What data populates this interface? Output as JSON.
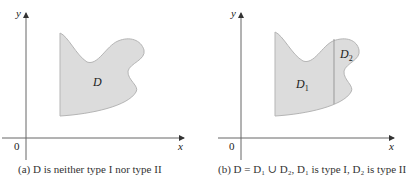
{
  "panels": [
    {
      "id": "a",
      "axis_labels": {
        "x": "x",
        "y": "y",
        "origin": "0"
      },
      "region_label": "D",
      "caption": "(a) D is neither type I nor type II"
    },
    {
      "id": "b",
      "axis_labels": {
        "x": "x",
        "y": "y",
        "origin": "0"
      },
      "region_labels": {
        "d1": "D",
        "d1_sub": "1",
        "d2": "D",
        "d2_sub": "2"
      },
      "caption": "(b) D = D₁ ∪ D₂, D₁ is type I, D₂ is type II"
    }
  ],
  "colors": {
    "region_fill": "#dcdcdc",
    "region_stroke": "#b0b0b0",
    "axis": "#555555",
    "text": "#222222"
  }
}
